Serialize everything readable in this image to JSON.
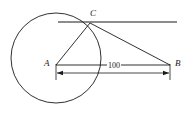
{
  "figure": {
    "name": "circle-tangent-triangle-diagram",
    "background_color": "#ffffff",
    "stroke_color": "#1a1a1a",
    "width": 190,
    "height": 115
  },
  "labels": {
    "point_a": "A",
    "point_b": "B",
    "point_c": "C",
    "distance_ab": "100"
  },
  "geometry": {
    "circle": {
      "cx": 56,
      "cy": 58,
      "r": 45
    },
    "points": {
      "A": {
        "x": 56,
        "y": 65
      },
      "B": {
        "x": 170,
        "y": 65
      },
      "C": {
        "x": 90,
        "y": 23
      }
    },
    "tangent_line": {
      "x1": 58,
      "y1": 22,
      "x2": 177,
      "y2": 22
    },
    "dimension_line": {
      "x1": 56,
      "y1": 73,
      "x2": 170,
      "y2": 73
    }
  }
}
